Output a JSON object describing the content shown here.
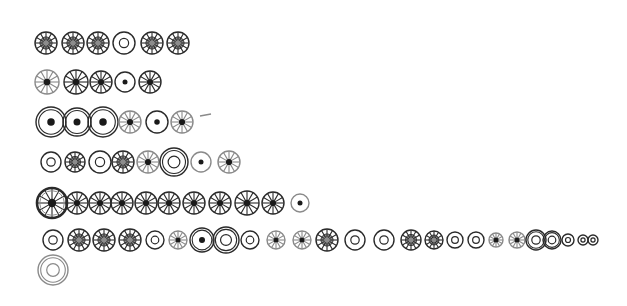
{
  "sketch": {
    "description": "Hand-drawn rows of circular symbols",
    "rows": [
      {
        "name": "row-1",
        "y": 43,
        "items": [
          {
            "x": 46,
            "r": 11,
            "type": "spoked-filled"
          },
          {
            "x": 73,
            "r": 11,
            "type": "spoked-filled"
          },
          {
            "x": 98,
            "r": 11,
            "type": "spoked-filled"
          },
          {
            "x": 124,
            "r": 11,
            "type": "ring"
          },
          {
            "x": 152,
            "r": 11,
            "type": "spoked-filled"
          },
          {
            "x": 178,
            "r": 11,
            "type": "spoked-filled"
          }
        ]
      },
      {
        "name": "row-2",
        "y": 82,
        "items": [
          {
            "x": 47,
            "r": 12,
            "type": "spoked-dot-light"
          },
          {
            "x": 76,
            "r": 12,
            "type": "spoked-dot"
          },
          {
            "x": 101,
            "r": 11,
            "type": "spoked-dot"
          },
          {
            "x": 125,
            "r": 10,
            "type": "dot-ring"
          },
          {
            "x": 150,
            "r": 11,
            "type": "spoked-dot"
          }
        ]
      },
      {
        "name": "row-3",
        "y": 122,
        "items": [
          {
            "x": 51,
            "r": 15,
            "type": "double-dot-ring"
          },
          {
            "x": 77,
            "r": 14,
            "type": "double-dot-ring"
          },
          {
            "x": 103,
            "r": 15,
            "type": "double-dot-ring"
          },
          {
            "x": 130,
            "r": 11,
            "type": "spoked-dot-light"
          },
          {
            "x": 157,
            "r": 11,
            "type": "dot-ring"
          },
          {
            "x": 182,
            "r": 11,
            "type": "spoked-dot-light"
          }
        ],
        "marks": [
          {
            "x1": 200,
            "y1": 116,
            "x2": 211,
            "y2": 114
          }
        ]
      },
      {
        "name": "row-4",
        "y": 162,
        "items": [
          {
            "x": 51,
            "r": 10,
            "type": "ring"
          },
          {
            "x": 75,
            "r": 10,
            "type": "spoked-filled"
          },
          {
            "x": 100,
            "r": 11,
            "type": "ring"
          },
          {
            "x": 123,
            "r": 11,
            "type": "spoked-filled"
          },
          {
            "x": 148,
            "r": 11,
            "type": "spoked-dot-light"
          },
          {
            "x": 174,
            "r": 14,
            "type": "double-ring"
          },
          {
            "x": 201,
            "r": 10,
            "type": "dot-ring-light"
          },
          {
            "x": 229,
            "r": 11,
            "type": "spoked-dot-light"
          }
        ]
      },
      {
        "name": "row-5",
        "y": 203,
        "items": [
          {
            "x": 52,
            "r": 15,
            "type": "bold-spoked-dot"
          },
          {
            "x": 77,
            "r": 11,
            "type": "spoked-dot"
          },
          {
            "x": 100,
            "r": 11,
            "type": "spoked-dot"
          },
          {
            "x": 122,
            "r": 11,
            "type": "spoked-dot"
          },
          {
            "x": 146,
            "r": 11,
            "type": "spoked-dot"
          },
          {
            "x": 169,
            "r": 11,
            "type": "spoked-dot"
          },
          {
            "x": 194,
            "r": 11,
            "type": "spoked-dot"
          },
          {
            "x": 220,
            "r": 11,
            "type": "spoked-dot"
          },
          {
            "x": 247,
            "r": 12,
            "type": "spoked-dot"
          },
          {
            "x": 273,
            "r": 11,
            "type": "spoked-dot"
          },
          {
            "x": 300,
            "r": 9,
            "type": "dot-ring-light"
          }
        ]
      },
      {
        "name": "row-6",
        "y": 240,
        "items": [
          {
            "x": 53,
            "r": 10,
            "type": "ring"
          },
          {
            "x": 79,
            "r": 11,
            "type": "spoked-filled"
          },
          {
            "x": 104,
            "r": 11,
            "type": "spoked-filled"
          },
          {
            "x": 130,
            "r": 11,
            "type": "spoked-filled"
          },
          {
            "x": 155,
            "r": 9,
            "type": "ring"
          },
          {
            "x": 178,
            "r": 9,
            "type": "spoked-dot-light"
          },
          {
            "x": 202,
            "r": 12,
            "type": "double-dot-ring"
          },
          {
            "x": 226,
            "r": 13,
            "type": "double-ring"
          },
          {
            "x": 250,
            "r": 9,
            "type": "ring"
          },
          {
            "x": 276,
            "r": 9,
            "type": "spoked-dot-light"
          },
          {
            "x": 302,
            "r": 9,
            "type": "spoked-dot-light"
          },
          {
            "x": 327,
            "r": 11,
            "type": "spoked-filled"
          },
          {
            "x": 355,
            "r": 10,
            "type": "ring"
          },
          {
            "x": 384,
            "r": 10,
            "type": "ring"
          },
          {
            "x": 411,
            "r": 10,
            "type": "spoked-filled"
          },
          {
            "x": 434,
            "r": 9,
            "type": "spoked-filled"
          },
          {
            "x": 455,
            "r": 8,
            "type": "ring"
          },
          {
            "x": 476,
            "r": 8,
            "type": "ring"
          },
          {
            "x": 496,
            "r": 7,
            "type": "spoked-dot-light"
          },
          {
            "x": 517,
            "r": 8,
            "type": "spoked-dot-light"
          },
          {
            "x": 536,
            "r": 10,
            "type": "double-ring"
          },
          {
            "x": 552,
            "r": 9,
            "type": "double-ring"
          },
          {
            "x": 568,
            "r": 6,
            "type": "ring"
          },
          {
            "x": 583,
            "r": 5,
            "type": "ring"
          },
          {
            "x": 593,
            "r": 5,
            "type": "ring"
          }
        ]
      },
      {
        "name": "row-7",
        "y": 270,
        "items": [
          {
            "x": 53,
            "r": 15,
            "type": "double-ring-light"
          }
        ]
      }
    ]
  },
  "colors": {
    "ink": "#2a2a2a",
    "ink_light": "#8a8a8a",
    "fill": "#6f6f6f",
    "paper": "#ffffff"
  }
}
